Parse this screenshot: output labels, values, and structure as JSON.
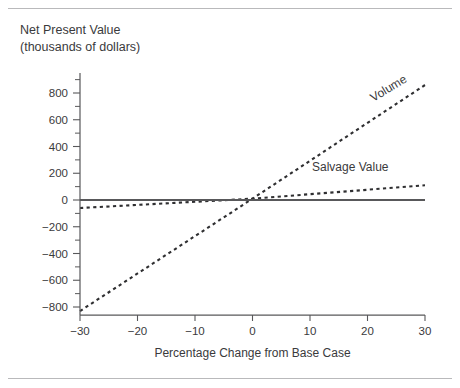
{
  "title": {
    "line1": "Net Present Value",
    "line2": "(thousands of dollars)"
  },
  "chart_data": {
    "type": "line",
    "title": "Net Present Value (thousands of dollars)",
    "xlabel": "Percentage Change from Base Case",
    "ylabel": "Net Present Value (thousands of dollars)",
    "xlim": [
      -30,
      30
    ],
    "ylim": [
      -900,
      950
    ],
    "grid": false,
    "legend": "inline-end-of-line",
    "x_ticks": [
      -30,
      -20,
      -10,
      0,
      10,
      20,
      30
    ],
    "x_tick_labels": [
      "−30",
      "−20",
      "−10",
      "0",
      "10",
      "20",
      "30"
    ],
    "y_ticks": [
      -800,
      -600,
      -400,
      -200,
      0,
      200,
      400,
      600,
      800
    ],
    "y_tick_labels": [
      "−800",
      "−600",
      "−400",
      "−200",
      "0",
      "200",
      "400",
      "600",
      "800"
    ],
    "y_minor_ticks": [
      -700,
      -500,
      -300,
      -100,
      100,
      300,
      500,
      700,
      900
    ],
    "series": [
      {
        "name": "Volume",
        "style": "dashed",
        "color": "#2f2f31",
        "x": [
          -30,
          0,
          30
        ],
        "values": [
          -830,
          10,
          860
        ]
      },
      {
        "name": "Salvage Value",
        "style": "dashed",
        "color": "#2f2f31",
        "x": [
          -30,
          0,
          30
        ],
        "values": [
          -60,
          10,
          110
        ]
      },
      {
        "name": "",
        "style": "solid",
        "color": "#58585a",
        "x": [
          -30,
          30
        ],
        "values": [
          0,
          0
        ]
      }
    ],
    "annotations": [
      {
        "text": "Volume",
        "x": 24,
        "y": 810,
        "rotation": -31
      },
      {
        "text": "Salvage Value",
        "x": 17,
        "y": 215,
        "rotation": 0
      }
    ]
  }
}
